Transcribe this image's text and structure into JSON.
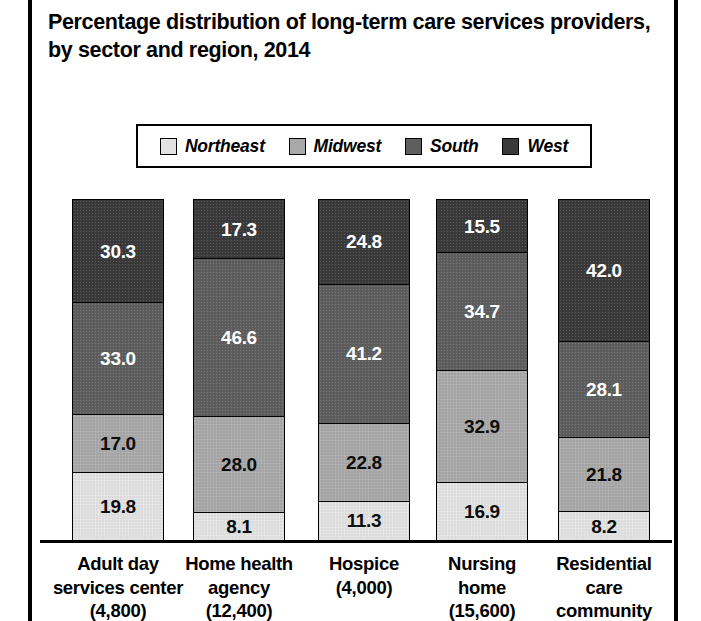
{
  "title": "Percentage distribution of long-term care services providers, by sector and region, 2014",
  "legend": {
    "items": [
      {
        "label": "Northeast",
        "color": "#e2e2e2",
        "swatch_name": "legend-swatch-northeast"
      },
      {
        "label": "Midwest",
        "color": "#a9a9a9",
        "swatch_name": "legend-swatch-midwest"
      },
      {
        "label": "South",
        "color": "#5e5e5e",
        "swatch_name": "legend-swatch-south"
      },
      {
        "label": "West",
        "color": "#3a3a3a",
        "swatch_name": "legend-swatch-west"
      }
    ]
  },
  "categories": [
    {
      "lines": [
        "Adult day",
        "services center",
        "(4,800)"
      ]
    },
    {
      "lines": [
        "Home health",
        "agency",
        "(12,400)"
      ]
    },
    {
      "lines": [
        "Hospice",
        "(4,000)"
      ]
    },
    {
      "lines": [
        "Nursing",
        "home",
        "(15,600)"
      ]
    },
    {
      "lines": [
        "Residential",
        "care",
        "community"
      ]
    }
  ],
  "bars": [
    {
      "name": "adult-day-services-center",
      "segments": [
        {
          "region": "West",
          "value": "30.3"
        },
        {
          "region": "South",
          "value": "33.0"
        },
        {
          "region": "Midwest",
          "value": "17.0"
        },
        {
          "region": "Northeast",
          "value": "19.8"
        }
      ]
    },
    {
      "name": "home-health-agency",
      "segments": [
        {
          "region": "West",
          "value": "17.3"
        },
        {
          "region": "South",
          "value": "46.6"
        },
        {
          "region": "Midwest",
          "value": "28.0"
        },
        {
          "region": "Northeast",
          "value": "8.1"
        }
      ]
    },
    {
      "name": "hospice",
      "segments": [
        {
          "region": "West",
          "value": "24.8"
        },
        {
          "region": "South",
          "value": "41.2"
        },
        {
          "region": "Midwest",
          "value": "22.8"
        },
        {
          "region": "Northeast",
          "value": "11.3"
        }
      ]
    },
    {
      "name": "nursing-home",
      "segments": [
        {
          "region": "West",
          "value": "15.5"
        },
        {
          "region": "South",
          "value": "34.7"
        },
        {
          "region": "Midwest",
          "value": "32.9"
        },
        {
          "region": "Northeast",
          "value": "16.9"
        }
      ]
    },
    {
      "name": "residential-care-community",
      "segments": [
        {
          "region": "West",
          "value": "42.0"
        },
        {
          "region": "South",
          "value": "28.1"
        },
        {
          "region": "Midwest",
          "value": "21.8"
        },
        {
          "region": "Northeast",
          "value": "8.2"
        }
      ]
    }
  ],
  "chart_data": {
    "type": "bar",
    "subtype": "stacked-percentage",
    "orientation": "vertical",
    "title": "Percentage distribution of long-term care services providers, by sector and region, 2014",
    "xlabel": "",
    "ylabel": "",
    "ylim": [
      0,
      100
    ],
    "grid": false,
    "legend_position": "top",
    "value_labels": true,
    "stack_order_bottom_to_top": [
      "Northeast",
      "Midwest",
      "South",
      "West"
    ],
    "categories": [
      "Adult day services center (4,800)",
      "Home health agency (12,400)",
      "Hospice (4,000)",
      "Nursing home (15,600)",
      "Residential care community"
    ],
    "category_counts": [
      4800,
      12400,
      4000,
      15600,
      null
    ],
    "series": [
      {
        "name": "Northeast",
        "color": "#e2e2e2",
        "values": [
          19.8,
          8.1,
          11.3,
          16.9,
          8.2
        ]
      },
      {
        "name": "Midwest",
        "color": "#a9a9a9",
        "values": [
          17.0,
          28.0,
          22.8,
          32.9,
          21.8
        ]
      },
      {
        "name": "South",
        "color": "#5e5e5e",
        "values": [
          33.0,
          46.6,
          41.2,
          34.7,
          28.1
        ]
      },
      {
        "name": "West",
        "color": "#3a3a3a",
        "values": [
          30.3,
          17.3,
          24.8,
          15.5,
          42.0
        ]
      }
    ]
  }
}
